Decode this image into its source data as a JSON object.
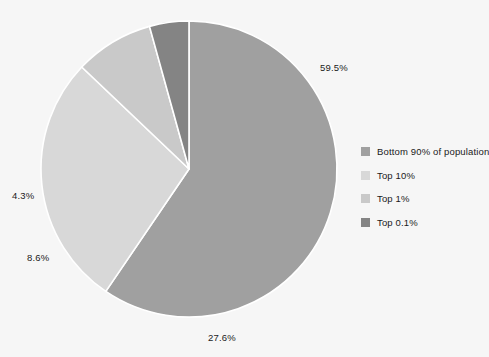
{
  "chart_data": {
    "type": "pie",
    "title": "",
    "subtitle": "",
    "xlabel": "",
    "ylabel": "",
    "legend_position": "right",
    "grid": false,
    "background_color": "#f6f6f6",
    "separator_color": "#ffffff",
    "center": {
      "x": 189,
      "y": 169
    },
    "radius": 148,
    "start_angle_deg": -90,
    "direction": "clockwise",
    "categories": [
      "Bottom 90% of population",
      "Top 10%",
      "Top 1%",
      "Top 0.1%"
    ],
    "values": [
      59.5,
      27.6,
      8.6,
      4.3
    ],
    "labels": [
      "59.5%",
      "27.6%",
      "8.6%",
      "4.3%"
    ],
    "colors": [
      "#a0a0a0",
      "#d8d8d8",
      "#c9c9c9",
      "#848484"
    ],
    "slices": [
      {
        "name": "Bottom 90% of population",
        "value": 59.5,
        "label": "59.5%",
        "color": "#a0a0a0",
        "label_x": 320,
        "label_y": 62
      },
      {
        "name": "Top 10%",
        "value": 27.6,
        "label": "27.6%",
        "color": "#d8d8d8",
        "label_x": 208,
        "label_y": 332
      },
      {
        "name": "Top 1%",
        "value": 8.6,
        "label": "8.6%",
        "color": "#c9c9c9",
        "label_x": 27,
        "label_y": 252
      },
      {
        "name": "Top 0.1%",
        "value": 4.3,
        "label": "4.3%",
        "color": "#848484",
        "label_x": 12,
        "label_y": 190
      }
    ]
  },
  "legend": {
    "items": [
      {
        "label": "Bottom 90% of population",
        "color": "#a0a0a0"
      },
      {
        "label": "Top 10%",
        "color": "#d8d8d8"
      },
      {
        "label": "Top 1%",
        "color": "#c9c9c9"
      },
      {
        "label": "Top 0.1%",
        "color": "#848484"
      }
    ]
  }
}
